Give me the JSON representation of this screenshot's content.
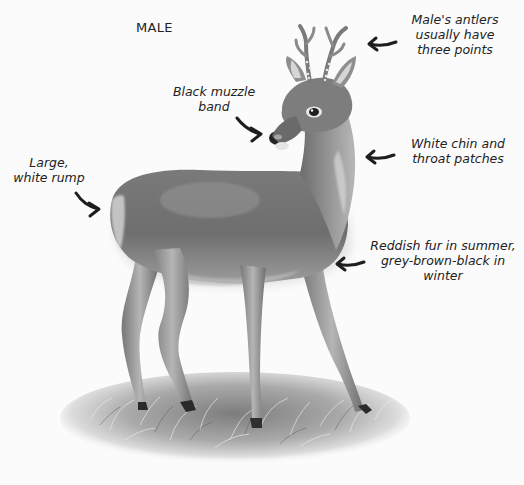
{
  "title": "MALE",
  "labels": {
    "antlers": "Male's antlers\nusually have\nthree points",
    "muzzle": "Black muzzle\nband",
    "rump": "Large,\nwhite rump",
    "chin": "White chin and\nthroat patches",
    "fur": "Reddish fur in summer,\ngrey-brown-black in\nwinter"
  },
  "illustration": {
    "subject": "roe deer (male)",
    "arrows": [
      "antlers-arrow",
      "muzzle-arrow",
      "rump-arrow",
      "chin-arrow",
      "fur-arrow"
    ]
  },
  "colors": {
    "background": "#fbfbfb",
    "text": "#222222",
    "arrow": "#1e1e1e",
    "fur_dark": "#5a5a5a",
    "fur_mid": "#8a8a8a",
    "fur_light": "#c8c8c8",
    "grass": "#9a9a9a"
  }
}
